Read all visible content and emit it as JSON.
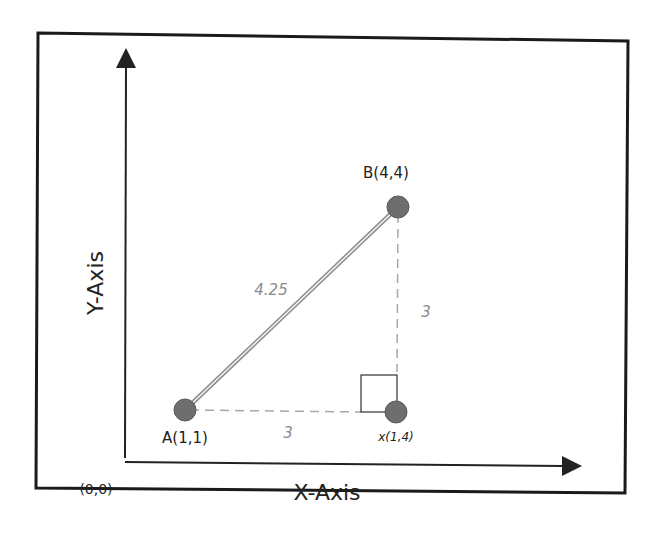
{
  "diagram": {
    "type": "euclidean-distance-right-triangle",
    "colors": {
      "frame": "#1a1a1a",
      "axis": "#222222",
      "point_fill": "#6e6e6e",
      "point_stroke": "#555555",
      "hypotenuse": "#9a9a9a",
      "dashed": "#a8a8a8",
      "measure_text": "#8a8a8a",
      "label_text": "#222222"
    },
    "axes": {
      "x_label": "X-Axis",
      "y_label": "Y-Axis",
      "origin_label": "(0,0)"
    },
    "points": [
      {
        "id": "A",
        "label": "A(1,1)"
      },
      {
        "id": "B",
        "label": "B(4,4)"
      },
      {
        "id": "X",
        "label": "x(1,4)"
      }
    ],
    "measures": {
      "hypotenuse": "4.25",
      "horizontal_leg": "3",
      "vertical_leg": "3"
    }
  }
}
